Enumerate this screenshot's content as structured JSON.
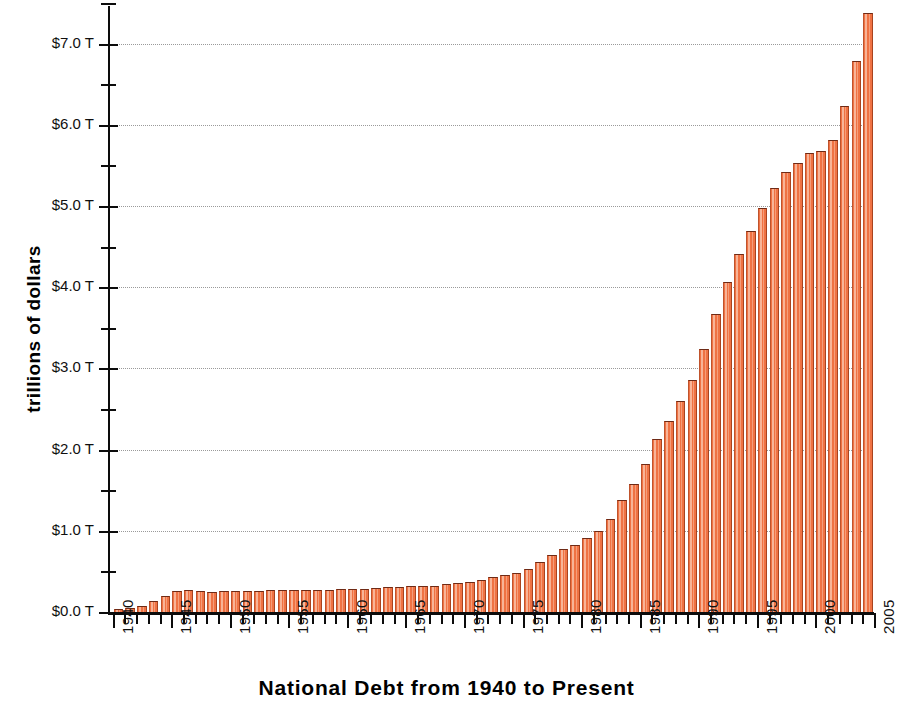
{
  "chart_data": {
    "type": "bar",
    "title": "National Debt from 1940 to Present",
    "xlabel": "",
    "ylabel": "trillions of dollars",
    "ylim": [
      0,
      7.6
    ],
    "xlim": [
      1939.5,
      2005
    ],
    "grid": true,
    "legend": "none",
    "bar_color": "#ef7243",
    "bar_edge_color": "#6d2a16",
    "axis_color": "#0c0c0c",
    "gridline_color": "#9a9a9a",
    "background_color": "#ffffff",
    "y_tick_labels": [
      "$0.0 T",
      "$1.0 T",
      "$2.0 T",
      "$3.0 T",
      "$4.0 T",
      "$5.0 T",
      "$6.0 T",
      "$7.0 T"
    ],
    "y_tick_values": [
      0,
      1,
      2,
      3,
      4,
      5,
      6,
      7
    ],
    "y_minor_tick_values": [
      0.5,
      1.5,
      2.5,
      3.5,
      4.5,
      5.5,
      6.5,
      7.5
    ],
    "x_tick_labels": [
      "1940",
      "1945",
      "1950",
      "1955",
      "1960",
      "1965",
      "1970",
      "1975",
      "1980",
      "1985",
      "1990",
      "1995",
      "2000",
      "2005"
    ],
    "x_tick_values": [
      1940,
      1945,
      1950,
      1955,
      1960,
      1965,
      1970,
      1975,
      1980,
      1985,
      1990,
      1995,
      2000,
      2005
    ],
    "units": "trillions of dollars",
    "categories": [
      1940,
      1941,
      1942,
      1943,
      1944,
      1945,
      1946,
      1947,
      1948,
      1949,
      1950,
      1951,
      1952,
      1953,
      1954,
      1955,
      1956,
      1957,
      1958,
      1959,
      1960,
      1961,
      1962,
      1963,
      1964,
      1965,
      1966,
      1967,
      1968,
      1969,
      1970,
      1971,
      1972,
      1973,
      1974,
      1975,
      1976,
      1977,
      1978,
      1979,
      1980,
      1981,
      1982,
      1983,
      1984,
      1985,
      1986,
      1987,
      1988,
      1989,
      1990,
      1991,
      1992,
      1993,
      1994,
      1995,
      1996,
      1997,
      1998,
      1999,
      2000,
      2001,
      2002,
      2003,
      2004
    ],
    "values": [
      0.043,
      0.049,
      0.072,
      0.137,
      0.201,
      0.259,
      0.269,
      0.258,
      0.252,
      0.253,
      0.257,
      0.255,
      0.259,
      0.266,
      0.271,
      0.274,
      0.273,
      0.271,
      0.276,
      0.285,
      0.286,
      0.289,
      0.298,
      0.306,
      0.312,
      0.317,
      0.32,
      0.326,
      0.348,
      0.354,
      0.371,
      0.398,
      0.427,
      0.458,
      0.475,
      0.533,
      0.62,
      0.699,
      0.772,
      0.827,
      0.908,
      0.998,
      1.142,
      1.377,
      1.572,
      1.823,
      2.125,
      2.35,
      2.602,
      2.857,
      3.233,
      3.665,
      4.065,
      4.411,
      4.693,
      4.974,
      5.225,
      5.413,
      5.526,
      5.656,
      5.674,
      5.807,
      6.228,
      6.783,
      7.379
    ]
  }
}
